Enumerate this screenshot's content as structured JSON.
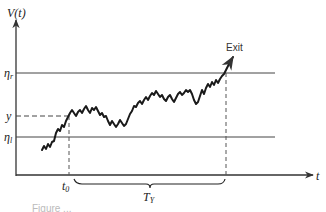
{
  "diagram": {
    "y_axis_label": "V(t)",
    "x_axis_label": "t",
    "upper_threshold": {
      "symbol": "η",
      "subscript": "r"
    },
    "lower_threshold": {
      "symbol": "η",
      "subscript": "l"
    },
    "start_level_label": "y",
    "start_time": {
      "symbol": "t",
      "subscript": "0"
    },
    "duration": {
      "symbol": "T",
      "subscript": "Y"
    },
    "exit_label": "Exit",
    "caption": "Figure ..."
  },
  "colors": {
    "line": "#333333",
    "path": "#1a1a1a",
    "background": "#ffffff"
  }
}
